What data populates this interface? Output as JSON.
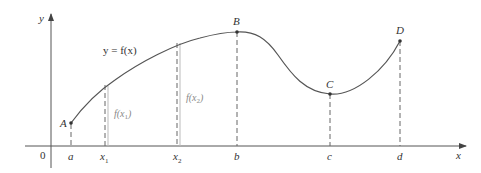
{
  "diagram": {
    "axes": {
      "x_label": "x",
      "y_label": "y",
      "origin_label": "0"
    },
    "curve_label": "y = f(x)",
    "points": [
      {
        "name": "A",
        "tick": "a"
      },
      {
        "name": "B",
        "tick": "b"
      },
      {
        "name": "C",
        "tick": "c"
      },
      {
        "name": "D",
        "tick": "d"
      }
    ],
    "sample_ticks": [
      {
        "tick": "x",
        "sub": "1",
        "value_label": "f(x",
        "value_sub": "1",
        "value_close": ")"
      },
      {
        "tick": "x",
        "sub": "2",
        "value_label": "f(x",
        "value_sub": "2",
        "value_close": ")"
      }
    ],
    "colors": {
      "axis": "#555555",
      "curve": "#555555",
      "dashed": "#666666",
      "value_label": "#888888"
    }
  }
}
